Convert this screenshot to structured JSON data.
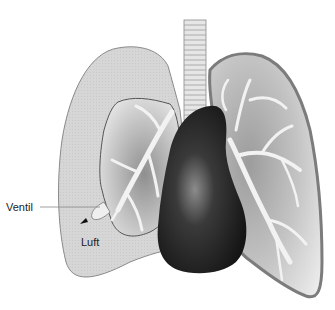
{
  "figure": {
    "labels": {
      "valve": "Ventil",
      "air": "Luft"
    },
    "colors": {
      "background": "#ffffff",
      "pleural_air": "#d4d4d4",
      "pleural_air_stroke": "#8a8a8a",
      "lung_light": "#eeeeee",
      "lung_dark": "#9a9a9a",
      "right_lung_outline": "#7c7c7c",
      "bronchi": "#f2f2f2",
      "heart_dark": "#151515",
      "heart_mid": "#3a3a3a",
      "heart_highlight": "#8c8c8c",
      "trachea": "#e6e6e6",
      "leader_line": "#888888"
    }
  }
}
